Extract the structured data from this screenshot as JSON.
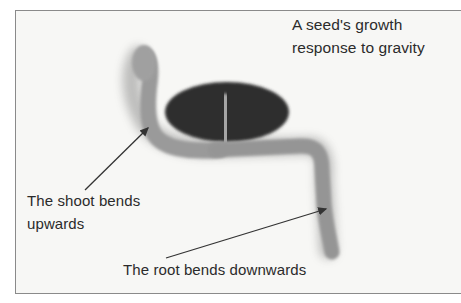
{
  "diagram": {
    "title_line1": "A seed's growth",
    "title_line2": "response to gravity",
    "labels": {
      "shoot_line1": "The shoot bends",
      "shoot_line2": "upwards",
      "root": "The root bends downwards"
    },
    "parts": [
      "seed",
      "shoot",
      "root"
    ],
    "colors": {
      "background": "#f7f7f5",
      "border": "#8a8a8a",
      "seed": "#2e2e2e",
      "seedling": "#9a9a9a",
      "text": "#2b2b2b",
      "arrow": "#333333"
    }
  }
}
